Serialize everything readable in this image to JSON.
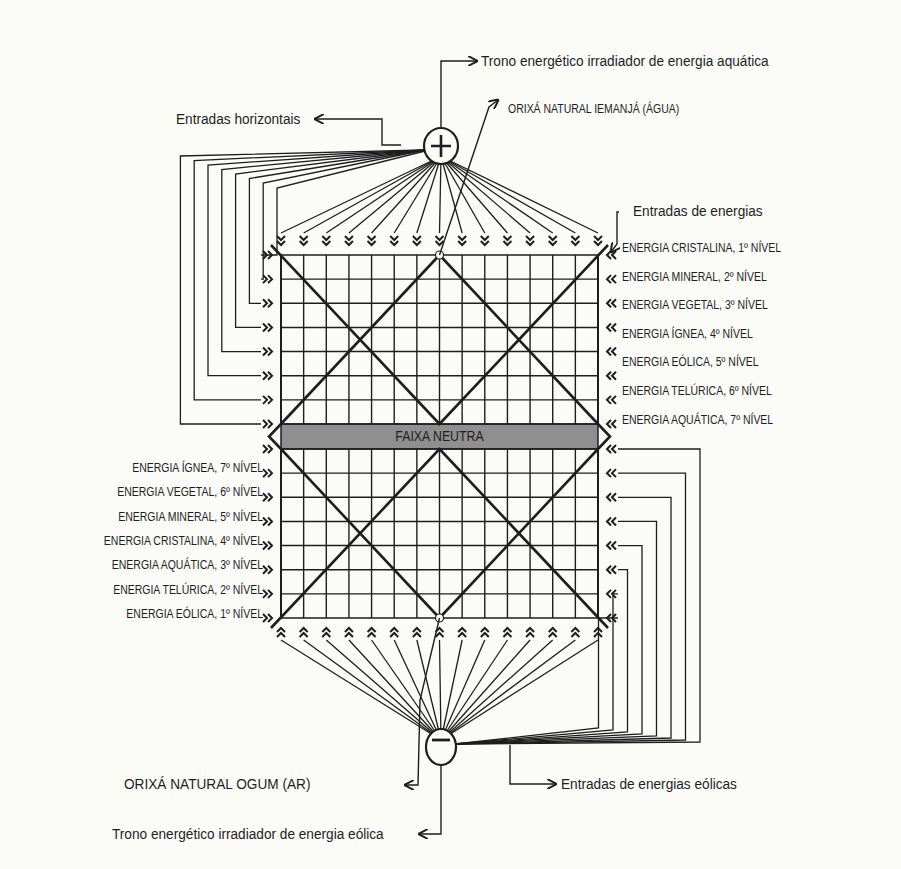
{
  "diagram": {
    "title_top": "Trono energético irradiador de energia aquática",
    "orixa_top": "ORIXÁ NATURAL IEMANJÁ (ÁGUA)",
    "horizontal_entries": "Entradas horizontais",
    "energy_entries": "Entradas de energias",
    "neutral_band": "FAIXA NEUTRA",
    "orixa_bottom": "ORIXÁ NATURAL OGUM (AR)",
    "eolic_entries": "Entradas de energias eólicas",
    "title_bottom": "Trono energético irradiador de energia eólica",
    "top_pole_symbol": "+",
    "bottom_pole_symbol": "−",
    "right_levels": [
      "ENERGIA CRISTALINA, 1º NÍVEL",
      "ENERGIA MINERAL, 2º NÍVEL",
      "ENERGIA VEGETAL, 3º NÍVEL",
      "ENERGIA ÍGNEA, 4º NÍVEL",
      "ENERGIA EÓLICA, 5º NÍVEL",
      "ENERGIA TELÚRICA, 6º NÍVEL",
      "ENERGIA AQUÁTICA, 7º NÍVEL"
    ],
    "left_levels": [
      "ENERGIA ÍGNEA, 7º NÍVEL",
      "ENERGIA VEGETAL, 6º NÍVEL",
      "ENERGIA MINERAL, 5º NÍVEL",
      "ENERGIA CRISTALINA, 4º NÍVEL",
      "ENERGIA AQUÁTICA, 3º NÍVEL",
      "ENERGIA TELÚRICA, 2º NÍVEL",
      "ENERGIA EÓLICA, 1º NÍVEL"
    ],
    "colors": {
      "ink": "#1e1e1e",
      "neutral_band": "#8f8f8f",
      "background": "#fbfbf8"
    }
  }
}
